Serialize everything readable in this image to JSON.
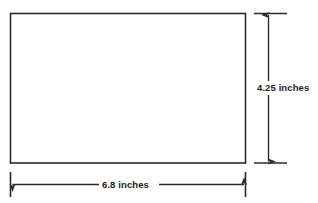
{
  "diagram": {
    "type": "rectangle-dimension-drawing",
    "shape": {
      "name": "rectangle",
      "fill": "#ffffff",
      "stroke": "#2b2b2b"
    },
    "line_color": "#2b2b2b",
    "text_color": "#1c1c1c",
    "background": "#ffffff",
    "dimensions": {
      "width": {
        "value": "6.8",
        "unit": "inches",
        "label": "6.8 inches",
        "orientation": "horizontal",
        "placement": "below"
      },
      "height": {
        "value": "4.25",
        "unit": "inches",
        "label": "4.25 inches",
        "orientation": "vertical",
        "placement": "right"
      }
    }
  }
}
